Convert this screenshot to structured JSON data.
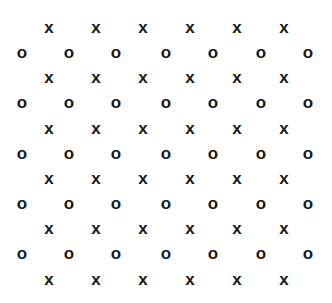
{
  "pattern": {
    "x_symbol": "x",
    "o_symbol": "o",
    "x_rows_y": [
      27,
      77,
      128,
      178,
      228,
      279
    ],
    "o_rows_y": [
      52,
      102,
      153,
      203,
      253
    ],
    "x_cols": [
      49,
      96,
      143,
      190,
      237,
      284
    ],
    "o_cols": [
      22,
      69,
      116,
      166,
      213,
      261,
      308
    ]
  }
}
